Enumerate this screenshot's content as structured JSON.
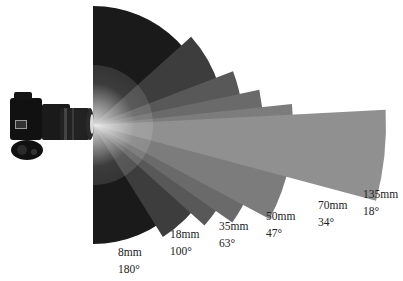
{
  "diagram": {
    "apex": [
      93,
      125
    ],
    "sectors": [
      {
        "focal": "8mm",
        "angle": "180°",
        "deg": 180,
        "r": 119,
        "color": "#1a1a1a",
        "label_pos": [
          118,
          244
        ]
      },
      {
        "focal": "18mm",
        "angle": "100°",
        "deg": 100,
        "r": 132,
        "color": "#3d3d3d",
        "label_pos": [
          170,
          226
        ]
      },
      {
        "focal": "35mm",
        "angle": "63°",
        "deg": 63,
        "r": 150,
        "color": "#585858",
        "label_pos": [
          219,
          218
        ]
      },
      {
        "focal": "50mm",
        "angle": "47°",
        "deg": 47,
        "r": 170,
        "color": "#6a6a6a",
        "label_pos": [
          266,
          208
        ]
      },
      {
        "focal": "70mm",
        "angle": "34°",
        "deg": 34,
        "r": 200,
        "color": "#7c7c7c",
        "label_pos": [
          318,
          197
        ]
      },
      {
        "focal": "135mm",
        "angle": "18°",
        "deg": 18,
        "r": 293,
        "color": "#909090",
        "label_pos": [
          363,
          186
        ]
      }
    ],
    "camera": {
      "icon": "dslr-camera-icon"
    }
  }
}
